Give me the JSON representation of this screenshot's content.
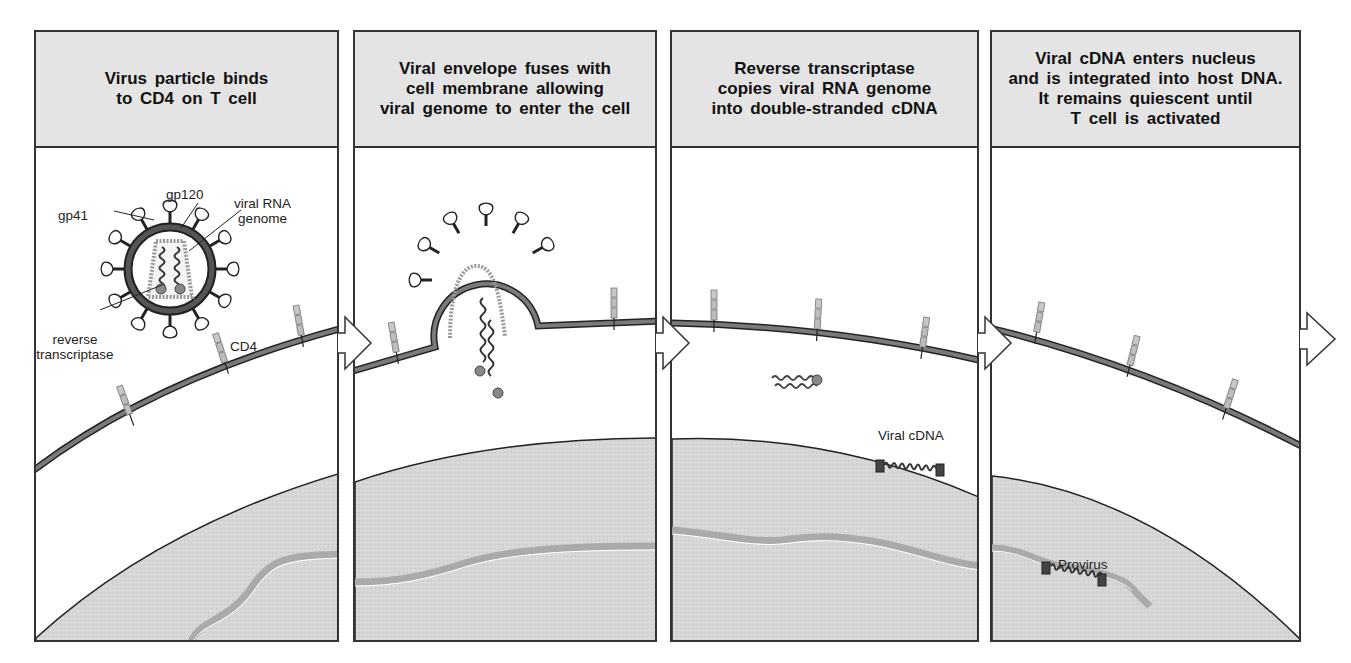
{
  "figure": {
    "colors": {
      "header_bg": "#e4e4e4",
      "nucleus_fill": "#d4d4d4",
      "membrane": "#6a6a6a",
      "outline": "#333333",
      "cd4_segment": "#bdbdbd"
    }
  },
  "panels": [
    {
      "step": 1,
      "title": "Virus particle binds\nto CD4 on T cell",
      "labels": {
        "gp120": "gp120",
        "gp41": "gp41",
        "viral_rna": "viral RNA\ngenome",
        "reverse_transcriptase": "reverse\ntranscriptase",
        "cd4": "CD4"
      }
    },
    {
      "step": 2,
      "title": "Viral envelope fuses with\ncell membrane allowing\nviral genome to enter the cell",
      "labels": {}
    },
    {
      "step": 3,
      "title": "Reverse transcriptase\ncopies viral RNA genome\ninto double-stranded cDNA",
      "labels": {
        "viral_cdna": "Viral cDNA"
      }
    },
    {
      "step": 4,
      "title": "Viral cDNA enters nucleus\nand is integrated into host DNA.\nIt remains quiescent until\nT cell is activated",
      "labels": {
        "provirus": "Provirus"
      }
    }
  ],
  "arrows": [
    {
      "from_step": 1,
      "to_step": 2,
      "icon": "right-arrow-icon"
    },
    {
      "from_step": 2,
      "to_step": 3,
      "icon": "right-arrow-icon"
    },
    {
      "from_step": 3,
      "to_step": 4,
      "icon": "right-arrow-icon"
    },
    {
      "from_step": 4,
      "to_step": 5,
      "icon": "right-arrow-icon"
    }
  ]
}
